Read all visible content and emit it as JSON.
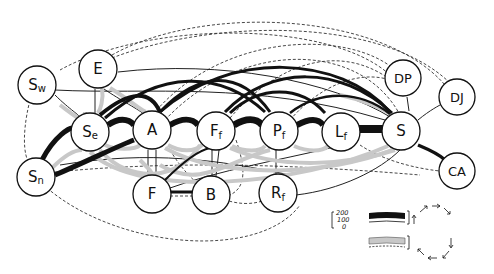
{
  "diagram": {
    "type": "node-link arc diagram",
    "nodes": [
      {
        "id": "Sw",
        "label": "S",
        "sub": "w",
        "x": 37,
        "y": 85
      },
      {
        "id": "E",
        "label": "E",
        "sub": "",
        "x": 98,
        "y": 69
      },
      {
        "id": "Se",
        "label": "S",
        "sub": "e",
        "x": 90,
        "y": 132
      },
      {
        "id": "Sn",
        "label": "S",
        "sub": "n",
        "x": 36,
        "y": 177
      },
      {
        "id": "A",
        "label": "A",
        "sub": "",
        "x": 152,
        "y": 130
      },
      {
        "id": "Ff",
        "label": "F",
        "sub": "f",
        "x": 216,
        "y": 131
      },
      {
        "id": "Pf",
        "label": "P",
        "sub": "f",
        "x": 279,
        "y": 131
      },
      {
        "id": "Lf",
        "label": "L",
        "sub": "f",
        "x": 341,
        "y": 132
      },
      {
        "id": "S",
        "label": "S",
        "sub": "",
        "x": 401,
        "y": 131
      },
      {
        "id": "DP",
        "label": "DP",
        "sub": "",
        "x": 403,
        "y": 78
      },
      {
        "id": "DJ",
        "label": "DJ",
        "sub": "",
        "x": 457,
        "y": 97
      },
      {
        "id": "CA",
        "label": "CA",
        "sub": "",
        "x": 457,
        "y": 171
      },
      {
        "id": "F",
        "label": "F",
        "sub": "",
        "x": 152,
        "y": 194
      },
      {
        "id": "B",
        "label": "B",
        "sub": "",
        "x": 211,
        "y": 195
      },
      {
        "id": "Rf",
        "label": "R",
        "sub": "f",
        "x": 278,
        "y": 193
      }
    ]
  },
  "legend": {
    "scale_labels": [
      "200",
      "100",
      "0"
    ],
    "upper_band": "solid black band (clockwise flow)",
    "lower_band": "stippled band (counter-clockwise flow)"
  }
}
